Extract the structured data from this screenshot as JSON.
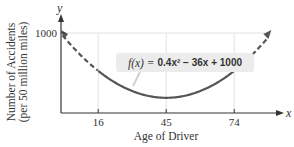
{
  "chart_data": {
    "type": "line",
    "title": "",
    "function_label": "f(x) = 0.4x² − 36x + 1000",
    "function_label_parts": {
      "lhs": "f(x) =",
      "rhs": "0.4x² − 36x + 1000"
    },
    "formula": {
      "a": 0.4,
      "b": -36,
      "c": 1000
    },
    "xlabel": "Age of Driver",
    "ylabel": "Number of Accidents",
    "ylabel_sub": "(per 50 million miles)",
    "x_axis_var": "x",
    "y_axis_var": "y",
    "x_ticks": [
      16,
      45,
      74
    ],
    "y_ticks": [
      1000
    ],
    "xlim": [
      0,
      95
    ],
    "ylim": [
      0,
      1000
    ],
    "grid": true,
    "series": [
      {
        "name": "f(x) solid (domain 16-74)",
        "style": "solid",
        "x": [
          16,
          20,
          25,
          30,
          35,
          40,
          45,
          50,
          55,
          60,
          65,
          70,
          74
        ],
        "values": [
          526.4,
          440,
          350,
          280,
          230,
          200,
          190,
          200,
          230,
          280,
          350,
          440,
          526.4
        ]
      },
      {
        "name": "f(x) dashed extension left",
        "style": "dashed",
        "x": [
          0,
          4,
          8,
          12,
          16
        ],
        "values": [
          1000,
          862.4,
          737.6,
          625.6,
          526.4
        ]
      },
      {
        "name": "f(x) dashed extension right",
        "style": "dashed",
        "x": [
          74,
          78,
          82,
          86,
          90
        ],
        "values": [
          526.4,
          625.6,
          737.6,
          862.4,
          1000
        ]
      }
    ],
    "colors": {
      "curve": "#555555",
      "axis": "#333333",
      "grid": "#e2e2e2",
      "label_bg": "#ececec"
    }
  }
}
